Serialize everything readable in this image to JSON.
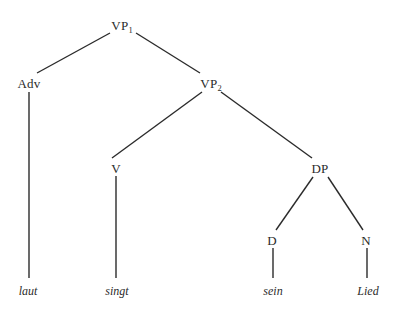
{
  "figure": {
    "kind": "syntax-tree",
    "language": "German",
    "sentence": "laut singt sein Lied",
    "background_color": "#ffffff",
    "line_color": "#2b2b2b",
    "text_color": "#2b2b2b"
  },
  "nodes": [
    {
      "id": "vp1",
      "label": "VP",
      "subscript": "1",
      "x": 122,
      "y": 25
    },
    {
      "id": "adv",
      "label": "Adv",
      "subscript": "",
      "x": 29,
      "y": 83
    },
    {
      "id": "vp2",
      "label": "VP",
      "subscript": "2",
      "x": 211,
      "y": 83
    },
    {
      "id": "v",
      "label": "V",
      "subscript": "",
      "x": 116,
      "y": 168
    },
    {
      "id": "dp",
      "label": "DP",
      "subscript": "",
      "x": 320,
      "y": 168
    },
    {
      "id": "d",
      "label": "D",
      "subscript": "",
      "x": 272,
      "y": 240
    },
    {
      "id": "n",
      "label": "N",
      "subscript": "",
      "x": 366,
      "y": 240
    }
  ],
  "leaves": [
    {
      "id": "laut",
      "label": "laut",
      "x": 28,
      "y": 291
    },
    {
      "id": "singt",
      "label": "singt",
      "x": 117,
      "y": 291
    },
    {
      "id": "sein",
      "label": "sein",
      "x": 273,
      "y": 291
    },
    {
      "id": "Lied",
      "label": "Lied",
      "x": 368,
      "y": 291
    }
  ],
  "edges": [
    {
      "id": "vp1-adv",
      "from": "vp1",
      "to": "adv",
      "x1": 110,
      "y1": 33,
      "x2": 37,
      "y2": 73
    },
    {
      "id": "vp1-vp2",
      "from": "vp1",
      "to": "vp2",
      "x1": 136,
      "y1": 33,
      "x2": 200,
      "y2": 73
    },
    {
      "id": "adv-laut",
      "from": "adv",
      "to": "laut",
      "x1": 29,
      "y1": 92,
      "x2": 29,
      "y2": 278
    },
    {
      "id": "vp2-v",
      "from": "vp2",
      "to": "v",
      "x1": 202,
      "y1": 92,
      "x2": 112,
      "y2": 158
    },
    {
      "id": "vp2-dp",
      "from": "vp2",
      "to": "dp",
      "x1": 221,
      "y1": 92,
      "x2": 312,
      "y2": 158
    },
    {
      "id": "v-singt",
      "from": "v",
      "to": "singt",
      "x1": 116,
      "y1": 176,
      "x2": 116,
      "y2": 278
    },
    {
      "id": "dp-d",
      "from": "dp",
      "to": "d",
      "x1": 313,
      "y1": 177,
      "x2": 276,
      "y2": 230
    },
    {
      "id": "dp-n",
      "from": "dp",
      "to": "n",
      "x1": 328,
      "y1": 177,
      "x2": 363,
      "y2": 230
    },
    {
      "id": "d-sein",
      "from": "d",
      "to": "sein",
      "x1": 273,
      "y1": 248,
      "x2": 273,
      "y2": 278
    },
    {
      "id": "n-Lied",
      "from": "n",
      "to": "Lied",
      "x1": 367,
      "y1": 248,
      "x2": 367,
      "y2": 278
    }
  ]
}
